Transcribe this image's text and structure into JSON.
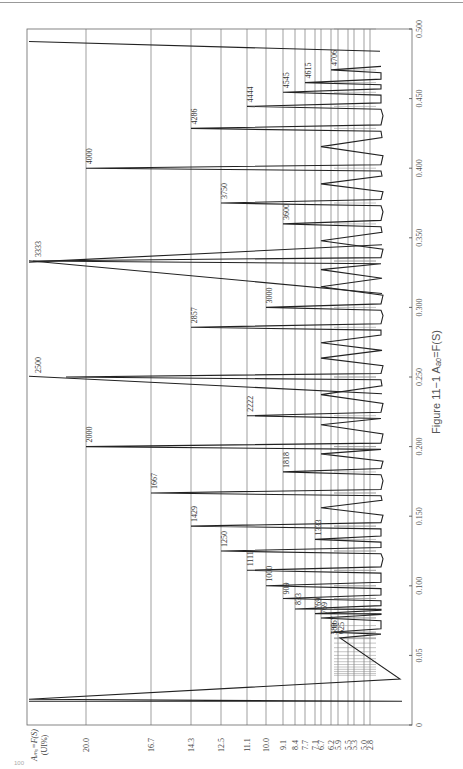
{
  "chart_data": {
    "type": "line",
    "orientation": "rotated-90-clockwise",
    "title": "Figure 11−1  Aₐₒ=F(S)",
    "caption": "Figure 11−1",
    "caption_formula": "Aₐₒ=F(S)",
    "xlabel": "S",
    "ylabel": "Aₘₒ=F(S) (UI%)",
    "ylabel_line1": "Aₘₒ=F(S)",
    "ylabel_line2": "(UI%)",
    "xlim": [
      0,
      0.5
    ],
    "x_ticks": [
      "0",
      "0.05",
      "0.100",
      "0.150",
      "0.200",
      "0.250",
      "0.300",
      "0.350",
      "0.400",
      "0.450",
      "0.500"
    ],
    "x_tick_values": [
      0,
      0.05,
      0.1,
      0.15,
      0.2,
      0.25,
      0.3,
      0.35,
      0.4,
      0.45,
      0.5
    ],
    "y_ticks": [
      "20.0",
      "16.7",
      "14.3",
      "12.5",
      "11.1",
      "10.0",
      "9.1",
      "8.4",
      "7.7",
      "7.1",
      "6.7",
      "6.2",
      "5.9",
      "5.5",
      "5.3",
      "5.0",
      "2.8"
    ],
    "grid": true,
    "peak_labels": [
      {
        "label": "588",
        "s": 0.062,
        "a": 6.2
      },
      {
        "label": "625",
        "s": 0.0625,
        "a": 5.9
      },
      {
        "label": "667",
        "s": 0.0667,
        "a": 6.2
      },
      {
        "label": "769",
        "s": 0.0769,
        "a": 6.7
      },
      {
        "label": "769",
        "s": 0.08,
        "a": 7.1
      },
      {
        "label": "833",
        "s": 0.0833,
        "a": 8.4
      },
      {
        "label": "909",
        "s": 0.0909,
        "a": 9.1
      },
      {
        "label": "1000",
        "s": 0.1,
        "a": 10.0
      },
      {
        "label": "1111",
        "s": 0.1111,
        "a": 11.1
      },
      {
        "label": "1250",
        "s": 0.125,
        "a": 12.5
      },
      {
        "label": "1333",
        "s": 0.1333,
        "a": 7.1
      },
      {
        "label": "1429",
        "s": 0.1429,
        "a": 14.3
      },
      {
        "label": "1667",
        "s": 0.1667,
        "a": 16.7
      },
      {
        "label": "1818",
        "s": 0.1818,
        "a": 9.1
      },
      {
        "label": "2000",
        "s": 0.2,
        "a": 20.0
      },
      {
        "label": "2222",
        "s": 0.2222,
        "a": 11.1
      },
      {
        "label": "2500",
        "s": 0.25,
        "a": 25.0
      },
      {
        "label": "2857",
        "s": 0.2857,
        "a": 14.3
      },
      {
        "label": "3000",
        "s": 0.3,
        "a": 10.0
      },
      {
        "label": "3333",
        "s": 0.3333,
        "a": 33.3
      },
      {
        "label": "3600",
        "s": 0.36,
        "a": 9.1
      },
      {
        "label": "3750",
        "s": 0.375,
        "a": 12.5
      },
      {
        "label": "4000",
        "s": 0.4,
        "a": 20.0
      },
      {
        "label": "4286",
        "s": 0.4286,
        "a": 14.3
      },
      {
        "label": "4444",
        "s": 0.4444,
        "a": 11.1
      },
      {
        "label": "4545",
        "s": 0.4545,
        "a": 9.1
      },
      {
        "label": "4615",
        "s": 0.4615,
        "a": 7.7
      },
      {
        "label": "4706",
        "s": 0.4706,
        "a": 6.2
      }
    ],
    "legend": null
  },
  "page": {
    "page_number": "100"
  }
}
